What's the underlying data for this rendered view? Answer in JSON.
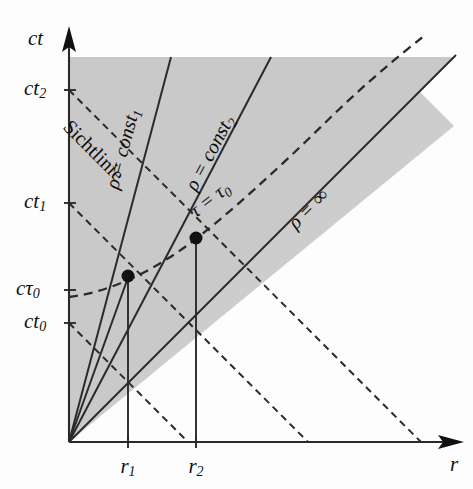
{
  "figure": {
    "type": "spacetime-diagram",
    "language": "de",
    "background_color": "#fdfdfd",
    "shaded_region_color": "#c9c9c9",
    "line_color": "#2b2b2b"
  },
  "axes": {
    "vertical": {
      "name": "ct-axis",
      "label": "ct",
      "origin_px": [
        68,
        442
      ],
      "top_px": [
        68,
        38
      ]
    },
    "horizontal": {
      "name": "r-axis",
      "label": "r",
      "origin_px": [
        68,
        442
      ],
      "right_px": [
        462,
        442
      ]
    }
  },
  "ticks": {
    "vertical": [
      {
        "id": "ct2",
        "base": "ct",
        "sub": "2",
        "y_px": 90
      },
      {
        "id": "ct1",
        "base": "ct",
        "sub": "1",
        "y_px": 203
      },
      {
        "id": "ctau0",
        "base": "cτ",
        "sub": "0",
        "y_px": 290
      },
      {
        "id": "ct0",
        "base": "ct",
        "sub": "0",
        "y_px": 323
      }
    ],
    "horizontal": [
      {
        "id": "r1",
        "base": "r",
        "sub": "1",
        "x_px": 128
      },
      {
        "id": "r2",
        "base": "r",
        "sub": "2",
        "x_px": 197
      }
    ]
  },
  "curve_labels": {
    "sichtlinie": "Sichtlinie",
    "rho_const1_base": "ρ = const",
    "rho_const1_sub": "1",
    "rho_const2_base": "ρ = const",
    "rho_const2_sub": "2",
    "tau_tau0_base": "τ = τ",
    "tau_tau0_sub": "0",
    "rho_infinity": "ρ = ∞"
  },
  "events": [
    {
      "id": "event-1",
      "x_px": 128,
      "y_px": 276,
      "r_tick": "r1",
      "ct_tick": "ctau0"
    },
    {
      "id": "event-2",
      "x_px": 196,
      "y_px": 238,
      "r_tick": "r2",
      "ct_tick": null
    }
  ]
}
